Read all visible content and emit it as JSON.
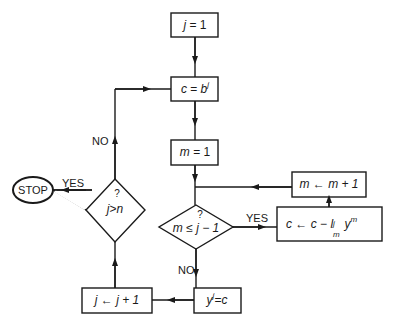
{
  "diagram": {
    "type": "flowchart",
    "nodes": {
      "init_j": {
        "shape": "rect",
        "var": "j",
        "op": "=",
        "value": "1"
      },
      "set_c": {
        "shape": "rect",
        "lhs": "c",
        "op": "=",
        "rhs": "b",
        "rhs_sup": "j"
      },
      "init_m": {
        "shape": "rect",
        "var": "m",
        "op": "=",
        "value": "1"
      },
      "incr_m": {
        "shape": "rect",
        "lhs": "m",
        "op": "←",
        "rhs": "m + 1"
      },
      "update_c": {
        "shape": "rect",
        "lhs": "c",
        "op": "←",
        "rhs1": "c",
        "minus": "−",
        "l": "l",
        "l_sup": "j",
        "l_sub": "m",
        "y": "y",
        "y_sup": "m"
      },
      "test_m": {
        "shape": "diamond",
        "q": "?",
        "lhs": "m",
        "op": "≤",
        "rhs": "j − 1"
      },
      "store_y": {
        "shape": "rect",
        "lhs": "y",
        "lhs_sup": "j",
        "op": "=",
        "rhs": "c"
      },
      "incr_j": {
        "shape": "rect",
        "lhs": "j",
        "op": "←",
        "rhs": "j + 1"
      },
      "test_j": {
        "shape": "diamond",
        "q": "?",
        "lhs": "j",
        "op": ">",
        "rhs": "n"
      },
      "stop": {
        "shape": "ellipse",
        "label": "STOP"
      }
    },
    "edge_labels": {
      "test_m_yes": "YES",
      "test_m_no": "NO",
      "test_j_yes": "YES",
      "test_j_no": "NO"
    },
    "edges": [
      [
        "init_j",
        "set_c"
      ],
      [
        "set_c",
        "init_m"
      ],
      [
        "init_m",
        "test_m"
      ],
      [
        "test_m",
        "update_c",
        "YES"
      ],
      [
        "update_c",
        "incr_m"
      ],
      [
        "incr_m",
        "test_m"
      ],
      [
        "test_m",
        "store_y",
        "NO"
      ],
      [
        "store_y",
        "incr_j"
      ],
      [
        "incr_j",
        "test_j"
      ],
      [
        "test_j",
        "stop",
        "YES"
      ],
      [
        "test_j",
        "set_c",
        "NO"
      ]
    ],
    "colors": {
      "stroke": "#1a1a1a",
      "background": "#ffffff"
    }
  }
}
